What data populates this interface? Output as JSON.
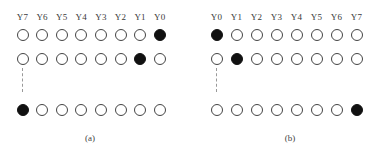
{
  "figure": {
    "panels": [
      {
        "id": "a",
        "caption": "(a)",
        "column_labels": [
          "Y7",
          "Y6",
          "Y5",
          "Y4",
          "Y3",
          "Y2",
          "Y1",
          "Y0"
        ],
        "rows": [
          [
            0,
            0,
            0,
            0,
            0,
            0,
            0,
            1
          ],
          [
            0,
            0,
            0,
            0,
            0,
            0,
            1,
            0
          ],
          [
            1,
            0,
            0,
            0,
            0,
            0,
            0,
            0
          ]
        ],
        "ellipsis_between_rows": [
          2,
          3
        ]
      },
      {
        "id": "b",
        "caption": "(b)",
        "column_labels": [
          "Y0",
          "Y1",
          "Y2",
          "Y3",
          "Y4",
          "Y5",
          "Y6",
          "Y7"
        ],
        "rows": [
          [
            1,
            0,
            0,
            0,
            0,
            0,
            0,
            0
          ],
          [
            0,
            1,
            0,
            0,
            0,
            0,
            0,
            0
          ],
          [
            0,
            0,
            0,
            0,
            0,
            0,
            0,
            1
          ]
        ],
        "ellipsis_between_rows": [
          2,
          3
        ]
      }
    ],
    "colors": {
      "filled": "#111111",
      "outline": "#444444",
      "dashed_line": "#999999"
    }
  }
}
